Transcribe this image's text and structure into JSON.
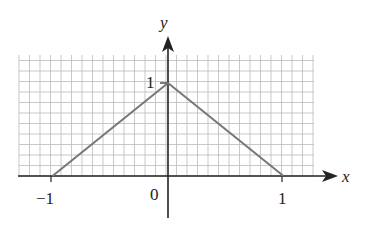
{
  "chart_data": {
    "type": "line",
    "title": "",
    "xlabel": "x",
    "ylabel": "y",
    "xlim": [
      -1.45,
      1.3
    ],
    "ylim": [
      0,
      1.3
    ],
    "grid": true,
    "x_ticks": [
      "-1",
      "0",
      "1"
    ],
    "y_ticks": [
      "1"
    ],
    "series": [
      {
        "name": "triangle function",
        "x": [
          -1,
          0,
          1
        ],
        "y": [
          0,
          1,
          0
        ],
        "color": "#777777"
      }
    ]
  },
  "labels": {
    "x_axis": "x",
    "y_axis": "y",
    "tick_neg1": "−1",
    "tick_0": "0",
    "tick_1": "1",
    "tick_y1": "1"
  }
}
